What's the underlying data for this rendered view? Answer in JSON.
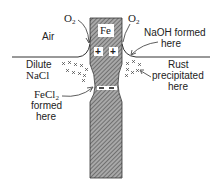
{
  "diagram": {
    "metal": "Fe",
    "labels": {
      "air": "Air",
      "o2_left": "O",
      "o2_left_sub": "2",
      "o2_right": "O",
      "o2_right_sub": "2",
      "dilute": "Dilute",
      "nacl": "NaCl",
      "naoh_line1": "NaOH formed",
      "naoh_line2": "here",
      "rust_line1": "Rust",
      "rust_line2": "precipitated",
      "rust_line3": "here",
      "fecl_line1": "FeCl",
      "fecl_sub": "2",
      "fecl_line2": "formed",
      "fecl_line3": "here",
      "plus1": "+",
      "plus2": "+"
    },
    "colors": {
      "line": "#333333",
      "hatch_bg": "#9a9a9a",
      "hatch_line": "#555555"
    }
  }
}
